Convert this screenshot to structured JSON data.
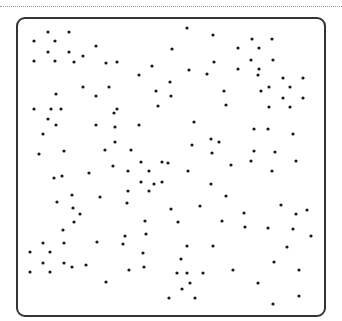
{
  "canvas": {
    "width": 342,
    "height": 321,
    "dot_color": "#1a1a1a",
    "dot_radius": 1.6,
    "border_color": "#333333",
    "rule_color": "#9a9a9a"
  },
  "dots": [
    [
      48,
      32
    ],
    [
      69,
      32
    ],
    [
      187,
      28
    ],
    [
      213,
      35
    ],
    [
      252,
      39
    ],
    [
      272,
      39
    ],
    [
      34,
      41
    ],
    [
      55,
      41
    ],
    [
      96,
      46
    ],
    [
      172,
      49
    ],
    [
      238,
      48
    ],
    [
      259,
      48
    ],
    [
      48,
      52
    ],
    [
      69,
      52
    ],
    [
      83,
      56
    ],
    [
      34,
      61
    ],
    [
      55,
      61
    ],
    [
      74,
      62
    ],
    [
      106,
      63
    ],
    [
      117,
      62
    ],
    [
      152,
      66
    ],
    [
      214,
      62
    ],
    [
      251,
      60
    ],
    [
      273,
      60
    ],
    [
      139,
      75
    ],
    [
      189,
      70
    ],
    [
      207,
      74
    ],
    [
      238,
      69
    ],
    [
      259,
      69
    ],
    [
      258,
      75
    ],
    [
      283,
      78
    ],
    [
      303,
      78
    ],
    [
      170,
      82
    ],
    [
      83,
      87
    ],
    [
      109,
      87
    ],
    [
      56,
      94
    ],
    [
      96,
      96
    ],
    [
      156,
      91
    ],
    [
      171,
      96
    ],
    [
      224,
      91
    ],
    [
      261,
      91
    ],
    [
      269,
      87
    ],
    [
      290,
      87
    ],
    [
      283,
      98
    ],
    [
      303,
      98
    ],
    [
      158,
      106
    ],
    [
      226,
      105
    ],
    [
      269,
      107
    ],
    [
      290,
      107
    ],
    [
      34,
      109
    ],
    [
      51,
      109
    ],
    [
      61,
      109
    ],
    [
      117,
      109
    ],
    [
      114,
      113
    ],
    [
      48,
      119
    ],
    [
      56,
      125
    ],
    [
      96,
      125
    ],
    [
      115,
      127
    ],
    [
      139,
      125
    ],
    [
      194,
      122
    ],
    [
      254,
      129
    ],
    [
      268,
      129
    ],
    [
      293,
      134
    ],
    [
      43,
      134
    ],
    [
      211,
      139
    ],
    [
      219,
      142
    ],
    [
      115,
      142
    ],
    [
      192,
      145
    ],
    [
      39,
      154
    ],
    [
      64,
      151
    ],
    [
      105,
      150
    ],
    [
      131,
      150
    ],
    [
      212,
      153
    ],
    [
      254,
      151
    ],
    [
      275,
      152
    ],
    [
      141,
      162
    ],
    [
      162,
      162
    ],
    [
      168,
      163
    ],
    [
      251,
      161
    ],
    [
      296,
      161
    ],
    [
      113,
      166
    ],
    [
      231,
      165
    ],
    [
      89,
      173
    ],
    [
      128,
      171
    ],
    [
      149,
      171
    ],
    [
      188,
      171
    ],
    [
      272,
      171
    ],
    [
      54,
      178
    ],
    [
      62,
      176
    ],
    [
      141,
      182
    ],
    [
      154,
      184
    ],
    [
      162,
      182
    ],
    [
      211,
      184
    ],
    [
      128,
      191
    ],
    [
      149,
      191
    ],
    [
      72,
      195
    ],
    [
      100,
      197
    ],
    [
      226,
      196
    ],
    [
      57,
      202
    ],
    [
      127,
      203
    ],
    [
      73,
      208
    ],
    [
      171,
      209
    ],
    [
      200,
      206
    ],
    [
      281,
      205
    ],
    [
      307,
      210
    ],
    [
      80,
      214
    ],
    [
      296,
      214
    ],
    [
      244,
      213
    ],
    [
      74,
      222
    ],
    [
      145,
      221
    ],
    [
      178,
      222
    ],
    [
      222,
      221
    ],
    [
      245,
      227
    ],
    [
      268,
      228
    ],
    [
      293,
      229
    ],
    [
      63,
      230
    ],
    [
      125,
      236
    ],
    [
      146,
      234
    ],
    [
      311,
      236
    ],
    [
      43,
      243
    ],
    [
      64,
      243
    ],
    [
      97,
      242
    ],
    [
      123,
      244
    ],
    [
      187,
      246
    ],
    [
      213,
      246
    ],
    [
      287,
      247
    ],
    [
      30,
      252
    ],
    [
      50,
      252
    ],
    [
      143,
      253
    ],
    [
      181,
      259
    ],
    [
      274,
      262
    ],
    [
      43,
      263
    ],
    [
      64,
      263
    ],
    [
      72,
      267
    ],
    [
      86,
      265
    ],
    [
      144,
      267
    ],
    [
      129,
      270
    ],
    [
      233,
      270
    ],
    [
      299,
      270
    ],
    [
      30,
      272
    ],
    [
      50,
      272
    ],
    [
      177,
      273
    ],
    [
      187,
      273
    ],
    [
      203,
      273
    ],
    [
      106,
      282
    ],
    [
      190,
      283
    ],
    [
      258,
      283
    ],
    [
      182,
      289
    ],
    [
      299,
      296
    ],
    [
      169,
      298
    ],
    [
      195,
      298
    ],
    [
      273,
      304
    ]
  ]
}
